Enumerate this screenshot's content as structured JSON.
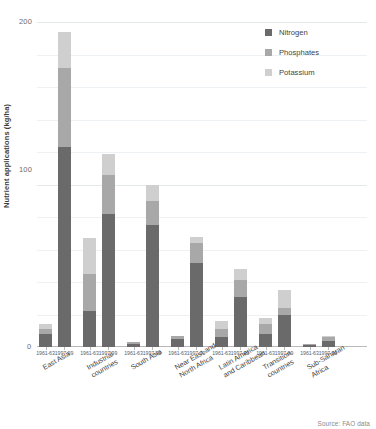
{
  "chart_data": {
    "type": "bar",
    "subtype": "stacked-bar-grouped",
    "title": "",
    "xlabel": "",
    "ylabel": "Nutrient applications (kg/ha)",
    "ylim": [
      0,
      200
    ],
    "yticks": [
      0,
      100,
      200
    ],
    "ytick_labels": [
      "0",
      "100",
      "200"
    ],
    "grid": true,
    "grid_axis": "y",
    "legend_position": "top-right",
    "legend": [
      "Nitrogen",
      "Phosphates",
      "Potassium"
    ],
    "series": [
      {
        "name": "Nitrogen",
        "color": "#6a6a6a",
        "values": [
          8,
          123,
          22,
          82,
          2,
          75,
          5,
          52,
          6,
          31,
          8,
          20,
          1,
          4
        ]
      },
      {
        "name": "Phosphates",
        "color": "#a8a8a8",
        "values": [
          3,
          49,
          23,
          24,
          1,
          15,
          2,
          12,
          5,
          10,
          6,
          4,
          1,
          2
        ]
      },
      {
        "name": "Potassium",
        "color": "#cfcfcf",
        "values": [
          3,
          22,
          22,
          13,
          0,
          10,
          0,
          4,
          5,
          7,
          4,
          11,
          0,
          1
        ]
      }
    ],
    "groups": [
      {
        "label": "East Asia",
        "periods": [
          "1961-63",
          "1997-99"
        ],
        "totals": [
          14,
          194
        ]
      },
      {
        "label": "Industrial\ncountries",
        "periods": [
          "1961-63",
          "1997-99"
        ],
        "totals": [
          67,
          119
        ]
      },
      {
        "label": "South Asia",
        "periods": [
          "1961-63",
          "1997-99"
        ],
        "totals": [
          3,
          100
        ]
      },
      {
        "label": "Near East and\nNorth Africa",
        "periods": [
          "1961-63",
          "1997-99"
        ],
        "totals": [
          7,
          68
        ]
      },
      {
        "label": "Latin America\nand Caribbean",
        "periods": [
          "1961-63",
          "1997-99"
        ],
        "totals": [
          16,
          48
        ]
      },
      {
        "label": "Transition\ncountries",
        "periods": [
          "1961-63",
          "1997-99"
        ],
        "totals": [
          18,
          35
        ]
      },
      {
        "label": "Sub-Saharan\nAfrica",
        "periods": [
          "1961-63",
          "1997-99"
        ],
        "totals": [
          2,
          7
        ]
      }
    ],
    "categories": [
      "East Asia 1961-63",
      "East Asia 1997-99",
      "Industrial countries 1961-63",
      "Industrial countries 1997-99",
      "South Asia 1961-63",
      "South Asia 1997-99",
      "Near East and North Africa 1961-63",
      "Near East and North Africa 1997-99",
      "Latin America and Caribbean 1961-63",
      "Latin America and Caribbean 1997-99",
      "Transition countries 1961-63",
      "Transition countries 1997-99",
      "Sub-Saharan Africa 1961-63",
      "Sub-Saharan Africa 1997-99"
    ],
    "source": "Source: FAO data"
  },
  "legend": {
    "items": [
      {
        "label": "Nitrogen",
        "color": "#6a6a6a"
      },
      {
        "label": "Phosphates",
        "color": "#a8a8a8"
      },
      {
        "label": "Potassium",
        "color": "#cfcfcf"
      }
    ]
  },
  "axes": {
    "y_title": "Nutrient applications (kg/ha)",
    "y_ticks": [
      "200",
      "100",
      "0"
    ]
  },
  "footer": {
    "source": "Source: FAO data"
  }
}
